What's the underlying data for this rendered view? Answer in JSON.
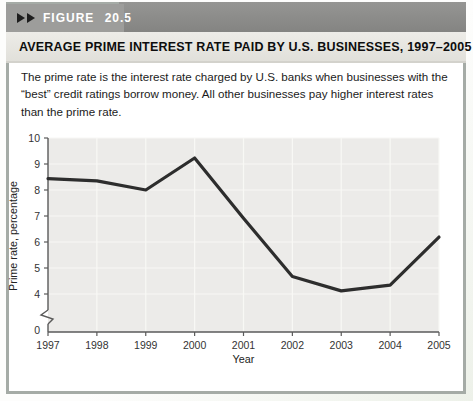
{
  "header": {
    "figure_label": "FIGURE 20.5",
    "title": "AVERAGE PRIME INTEREST RATE PAID BY U.S. BUSINESSES, 1997–2005"
  },
  "description": "The prime rate is the interest rate charged by U.S. banks when businesses with the “best” credit ratings borrow money. All other businesses pay higher interest rates than the prime rate.",
  "colors": {
    "header_band": "#8c8c8a",
    "figure_label_box": "#9d9d9b",
    "title_strip": "#e7e6e2",
    "frame_border": "#a5aba6",
    "axis": "#5a5a5a",
    "line": "#2d2d2d",
    "plot_background": "#ecebe9",
    "gridline": "#f8f8f5"
  },
  "chart_data": {
    "type": "line",
    "categories": [
      "1997",
      "1998",
      "1999",
      "2000",
      "2001",
      "2002",
      "2003",
      "2004",
      "2005"
    ],
    "values": [
      8.44,
      8.35,
      8.0,
      9.23,
      6.91,
      4.67,
      4.12,
      4.34,
      6.19
    ],
    "xlabel": "Year",
    "ylabel": "Prime rate, percentage",
    "y_ticks": [
      4,
      5,
      6,
      7,
      8,
      9,
      10
    ],
    "y_origin_label": "0",
    "axis_break": true,
    "ylim": [
      4,
      10
    ],
    "grid": true,
    "legend": "none",
    "line_color": "#2d2d2d",
    "plot_bg_color": "#ecebe9",
    "grid_color": "#f8f8f5",
    "axis_color": "#5a5a5a"
  }
}
